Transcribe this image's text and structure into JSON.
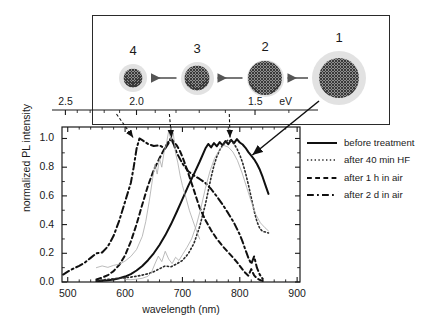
{
  "figure": {
    "kind": "photoluminescence-spectra-with-inset"
  },
  "axes": {
    "x": {
      "label": "wavelength (nm)",
      "ticks": [
        "500",
        "600",
        "700",
        "800",
        "900"
      ],
      "min": 490,
      "max": 905,
      "minor_step": 20
    },
    "y": {
      "label": "normalized PL intensity",
      "ticks": [
        "0.0",
        "0.2",
        "0.4",
        "0.6",
        "0.8",
        "1.0"
      ],
      "min": 0.0,
      "max": 1.08
    },
    "top": {
      "unit_label": "eV",
      "ticks": [
        "2.5",
        "2.0",
        "1.5"
      ],
      "tick_nm": [
        496,
        620,
        827
      ]
    }
  },
  "legend": {
    "position": "right",
    "items": [
      {
        "label": "before treatment",
        "style": "solid"
      },
      {
        "label": "after 40 min HF",
        "style": "dotted"
      },
      {
        "label": "after 1 h in air",
        "style": "dashed"
      },
      {
        "label": "after 2 d in air",
        "style": "dashdot"
      }
    ]
  },
  "inset": {
    "particles": [
      {
        "label": "4",
        "shell_d": 28,
        "core_d": 19
      },
      {
        "label": "3",
        "shell_d": 33,
        "core_d": 25
      },
      {
        "label": "2",
        "shell_d": 37,
        "core_d": 34
      },
      {
        "label": "1",
        "shell_d": 54,
        "core_d": 40
      }
    ],
    "arrows": 3,
    "arrow_direction": "left"
  },
  "annotations": [
    {
      "label": "1",
      "target_nm": 820,
      "target_y": 0.88
    },
    {
      "label": "2",
      "target_nm": 783,
      "target_y": 1.0
    },
    {
      "label": "3",
      "target_nm": 681,
      "target_y": 1.0
    },
    {
      "label": "4",
      "target_nm": 614,
      "target_y": 1.0
    }
  ],
  "chart_data": {
    "type": "line",
    "title": "",
    "xlabel": "wavelength (nm)",
    "ylabel": "normalized PL intensity",
    "xlim": [
      490,
      905
    ],
    "ylim": [
      0.0,
      1.08
    ],
    "grid": false,
    "legend_position": "right",
    "top_axis": {
      "label": "eV",
      "ticks": [
        2.5,
        2.0,
        1.5
      ]
    },
    "series": [
      {
        "name": "before treatment",
        "style": "solid",
        "color": "#101010",
        "width": 2.0,
        "peak_nm": 790,
        "x": [
          550,
          560,
          570,
          580,
          590,
          600,
          610,
          620,
          630,
          640,
          650,
          660,
          670,
          680,
          690,
          700,
          710,
          720,
          730,
          740,
          745,
          750,
          755,
          760,
          765,
          770,
          775,
          780,
          785,
          790,
          795,
          800,
          805,
          810,
          815,
          820,
          825,
          830,
          835,
          840,
          845,
          850
        ],
        "y": [
          0.005,
          0.008,
          0.012,
          0.018,
          0.026,
          0.038,
          0.055,
          0.08,
          0.112,
          0.152,
          0.2,
          0.258,
          0.325,
          0.402,
          0.488,
          0.578,
          0.668,
          0.752,
          0.838,
          0.93,
          0.962,
          0.938,
          0.968,
          0.946,
          0.975,
          0.952,
          0.982,
          0.96,
          0.99,
          0.968,
          0.996,
          0.972,
          0.958,
          0.935,
          0.905,
          0.88,
          0.855,
          0.822,
          0.782,
          0.73,
          0.672,
          0.614
        ]
      },
      {
        "name": "after 40 min HF",
        "style": "dotted",
        "color": "#2b2b2b",
        "width": 1.6,
        "peak_nm": 783,
        "x": [
          550,
          560,
          570,
          580,
          590,
          600,
          610,
          620,
          630,
          640,
          650,
          660,
          670,
          680,
          690,
          700,
          710,
          720,
          730,
          740,
          750,
          755,
          760,
          765,
          770,
          775,
          780,
          785,
          790,
          795,
          800,
          805,
          810,
          815,
          820,
          825,
          830,
          835,
          840,
          845,
          850
        ],
        "y": [
          0.01,
          0.014,
          0.018,
          0.022,
          0.026,
          0.03,
          0.034,
          0.04,
          0.048,
          0.058,
          0.072,
          0.092,
          0.112,
          0.106,
          0.126,
          0.15,
          0.196,
          0.268,
          0.385,
          0.54,
          0.73,
          0.812,
          0.875,
          0.92,
          0.952,
          0.975,
          0.99,
          0.982,
          0.962,
          0.93,
          0.886,
          0.83,
          0.76,
          0.678,
          0.588,
          0.496,
          0.42,
          0.372,
          0.352,
          0.348,
          0.342
        ]
      },
      {
        "name": "after 1 h in air",
        "style": "dashed",
        "color": "#101010",
        "width": 2.0,
        "peak_nm": 681,
        "x": [
          550,
          560,
          570,
          580,
          590,
          600,
          610,
          620,
          630,
          640,
          650,
          660,
          670,
          675,
          680,
          685,
          690,
          695,
          700,
          705,
          710,
          715,
          720,
          725,
          730,
          740,
          750,
          760,
          770,
          780,
          790,
          795,
          800,
          805,
          810,
          815,
          820,
          825,
          830,
          835,
          840
        ],
        "y": [
          0.018,
          0.03,
          0.048,
          0.076,
          0.12,
          0.186,
          0.282,
          0.402,
          0.54,
          0.672,
          0.78,
          0.862,
          0.938,
          0.975,
          1.0,
          0.978,
          0.952,
          0.918,
          0.872,
          0.818,
          0.76,
          0.7,
          0.64,
          0.578,
          0.518,
          0.432,
          0.36,
          0.3,
          0.25,
          0.206,
          0.162,
          0.138,
          0.112,
          0.086,
          0.062,
          0.044,
          0.09,
          0.046,
          0.026,
          0.014,
          0.008
        ]
      },
      {
        "name": "after 2 d in air",
        "style": "dashdot",
        "color": "#101010",
        "width": 2.0,
        "peak_nm": 625,
        "x": [
          492,
          500,
          510,
          520,
          530,
          540,
          550,
          560,
          570,
          580,
          590,
          600,
          610,
          615,
          620,
          625,
          630,
          640,
          650,
          660,
          670,
          675,
          680,
          685,
          690,
          700,
          710,
          720,
          730,
          740,
          750,
          760,
          770,
          780,
          790,
          800,
          805,
          810,
          815,
          820,
          825,
          830,
          835,
          840
        ],
        "y": [
          0.052,
          0.072,
          0.094,
          0.112,
          0.136,
          0.168,
          0.2,
          0.206,
          0.248,
          0.322,
          0.43,
          0.56,
          0.69,
          0.8,
          0.928,
          1.0,
          0.988,
          0.962,
          0.948,
          0.952,
          0.93,
          0.962,
          1.0,
          0.958,
          0.9,
          0.826,
          0.772,
          0.742,
          0.718,
          0.69,
          0.648,
          0.596,
          0.54,
          0.478,
          0.412,
          0.33,
          0.28,
          0.222,
          0.168,
          0.126,
          0.178,
          0.098,
          0.05,
          0.022
        ]
      },
      {
        "name": "raw-noise-trace-a",
        "style": "solid-thin",
        "color": "#a9a9a9",
        "width": 0.8,
        "x": [
          550,
          560,
          570,
          580,
          590,
          600,
          610,
          620,
          630,
          636,
          642,
          648,
          652,
          656,
          660,
          664,
          668,
          672,
          676,
          680,
          684,
          688,
          692,
          696,
          700,
          706,
          712,
          718,
          724,
          730
        ],
        "y": [
          0.1,
          0.112,
          0.102,
          0.116,
          0.124,
          0.146,
          0.178,
          0.226,
          0.318,
          0.42,
          0.56,
          0.722,
          0.82,
          0.752,
          0.86,
          0.8,
          0.905,
          0.96,
          1.052,
          0.99,
          1.038,
          0.9,
          0.83,
          0.742,
          0.672,
          0.59,
          0.5,
          0.43,
          0.362,
          0.3
        ]
      },
      {
        "name": "raw-noise-trace-b",
        "style": "solid-thin",
        "color": "#a9a9a9",
        "width": 0.8,
        "x": [
          600,
          610,
          620,
          630,
          640,
          646,
          652,
          658,
          664,
          670,
          676,
          682,
          688,
          694,
          700,
          708,
          716,
          724,
          732,
          740,
          748,
          756,
          764,
          772,
          780,
          788,
          796,
          804,
          812,
          820,
          828,
          836,
          844,
          850
        ],
        "y": [
          0.018,
          0.016,
          0.02,
          0.026,
          0.04,
          0.068,
          0.126,
          0.18,
          0.142,
          0.214,
          0.16,
          0.128,
          0.172,
          0.15,
          0.19,
          0.242,
          0.3,
          0.392,
          0.512,
          0.652,
          0.772,
          0.862,
          0.916,
          0.952,
          0.94,
          0.906,
          0.846,
          0.76,
          0.66,
          0.56,
          0.47,
          0.412,
          0.378,
          0.356
        ]
      }
    ]
  }
}
